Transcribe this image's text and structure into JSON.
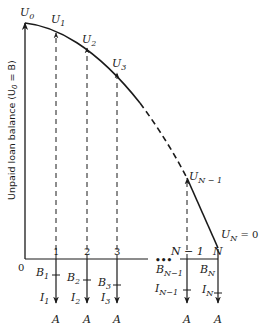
{
  "diagram": {
    "y_axis_label": "Unpaid loan balance (U",
    "y_axis_label_sub": "0",
    "y_axis_label_tail": " = B)",
    "origin_label": "0",
    "ellipsis": "•••",
    "curve_points": [
      {
        "name": "U",
        "sub": "0"
      },
      {
        "name": "U",
        "sub": "1"
      },
      {
        "name": "U",
        "sub": "2"
      },
      {
        "name": "U",
        "sub": "3"
      },
      {
        "name": "U",
        "sub": "N − 1"
      },
      {
        "name": "U",
        "sub": "N",
        "tail": " = 0"
      }
    ],
    "periods": [
      {
        "label": "1",
        "B": "1",
        "I": "1",
        "A": "A"
      },
      {
        "label": "2",
        "B": "2",
        "I": "2",
        "A": "A"
      },
      {
        "label": "3",
        "B": "3",
        "I": "3",
        "A": "A"
      },
      {
        "label": "N − 1",
        "B": "N−1",
        "I": "N−1",
        "A": "A"
      },
      {
        "label": "N",
        "B": "N",
        "I": "N",
        "A": "A"
      }
    ],
    "B_symbol": "B",
    "I_symbol": "I"
  }
}
